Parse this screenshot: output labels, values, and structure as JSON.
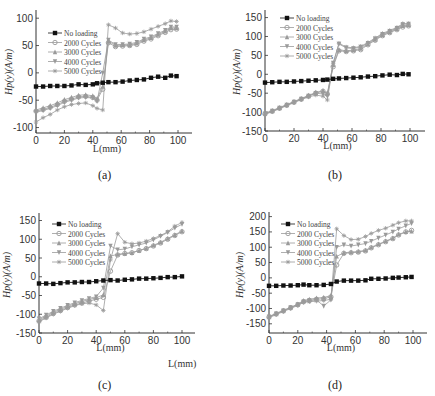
{
  "figure": {
    "captions": [
      "(a)",
      "(b)",
      "(c)",
      "(d)"
    ],
    "stray_xlabel": "L(mm)"
  },
  "colors": {
    "no_loading": "#111111",
    "cycles": "#9a9a9a",
    "axis": "#333333"
  },
  "chart_data": [
    {
      "type": "line",
      "panel": "(a)",
      "xlabel": "L(mm)",
      "ylabel": "Hp(y)(A/m)",
      "xlim": [
        0,
        110
      ],
      "ylim": [
        -110,
        115
      ],
      "xticks": [
        0,
        20,
        40,
        60,
        80,
        100
      ],
      "yticks": [
        -100,
        -50,
        0,
        50,
        100
      ],
      "x": [
        0,
        5,
        10,
        15,
        20,
        25,
        30,
        35,
        40,
        43,
        47,
        51,
        56,
        61,
        66,
        71,
        76,
        81,
        86,
        91,
        95,
        99
      ],
      "legend_position": "upper left",
      "series": [
        {
          "name": "No loading",
          "marker": "square",
          "values": [
            -25,
            -25,
            -24,
            -24,
            -24,
            -23,
            -21,
            -22,
            -21,
            -19,
            -18,
            -17,
            -17,
            -16,
            -14,
            -13,
            -12,
            -9,
            -7,
            -9,
            -5,
            -6
          ]
        },
        {
          "name": "2000 Cycles",
          "marker": "circle",
          "values": [
            -70,
            -67,
            -63,
            -58,
            -52,
            -48,
            -44,
            -43,
            -45,
            -50,
            -30,
            55,
            48,
            49,
            50,
            52,
            58,
            62,
            68,
            74,
            79,
            80
          ]
        },
        {
          "name": "3000 Cycles",
          "marker": "triangle-up",
          "values": [
            -68,
            -64,
            -60,
            -55,
            -49,
            -45,
            -41,
            -40,
            -42,
            -47,
            -25,
            58,
            50,
            51,
            51,
            54,
            60,
            64,
            70,
            76,
            82,
            82
          ]
        },
        {
          "name": "4000 Cycles",
          "marker": "triangle-down",
          "values": [
            -72,
            -69,
            -65,
            -60,
            -54,
            -50,
            -46,
            -45,
            -46,
            -52,
            0,
            60,
            52,
            52,
            53,
            56,
            62,
            66,
            72,
            78,
            84,
            84
          ]
        },
        {
          "name": "5000 Cycles",
          "marker": "star",
          "values": [
            -90,
            -82,
            -76,
            -68,
            -62,
            -58,
            -56,
            -55,
            -60,
            -65,
            -68,
            88,
            82,
            73,
            71,
            72,
            75,
            80,
            85,
            90,
            95,
            94
          ]
        }
      ]
    },
    {
      "type": "line",
      "panel": "(b)",
      "xlabel": "L(mm)",
      "ylabel": "Hp(y)(A/m)",
      "xlim": [
        0,
        110
      ],
      "ylim": [
        -150,
        170
      ],
      "xticks": [
        0,
        20,
        40,
        60,
        80,
        100
      ],
      "yticks": [
        -150,
        -100,
        -50,
        0,
        50,
        100,
        150
      ],
      "x": [
        0,
        5,
        10,
        15,
        20,
        25,
        30,
        35,
        40,
        43,
        47,
        51,
        56,
        61,
        66,
        71,
        76,
        81,
        86,
        91,
        95,
        99
      ],
      "legend_position": "upper left",
      "series": [
        {
          "name": "No loading",
          "marker": "square",
          "values": [
            -22,
            -21,
            -20,
            -20,
            -19,
            -18,
            -17,
            -16,
            -15,
            -14,
            -12,
            -11,
            -10,
            -9,
            -8,
            -6,
            -5,
            -3,
            -1,
            -2,
            1,
            0
          ]
        },
        {
          "name": "2000 Cycles",
          "marker": "circle",
          "values": [
            -105,
            -98,
            -90,
            -82,
            -74,
            -66,
            -58,
            -50,
            -45,
            -52,
            20,
            62,
            60,
            62,
            65,
            78,
            90,
            102,
            110,
            118,
            125,
            128
          ]
        },
        {
          "name": "3000 Cycles",
          "marker": "triangle-up",
          "values": [
            -103,
            -96,
            -88,
            -80,
            -72,
            -64,
            -56,
            -48,
            -43,
            -50,
            25,
            65,
            62,
            64,
            68,
            80,
            92,
            104,
            112,
            120,
            128,
            130
          ]
        },
        {
          "name": "4000 Cycles",
          "marker": "triangle-down",
          "values": [
            -104,
            -97,
            -89,
            -81,
            -73,
            -65,
            -57,
            -50,
            -52,
            -58,
            30,
            80,
            70,
            68,
            72,
            82,
            94,
            106,
            114,
            122,
            132,
            133
          ]
        },
        {
          "name": "5000 Cycles",
          "marker": "star",
          "values": [
            -106,
            -99,
            -91,
            -83,
            -75,
            -67,
            -60,
            -55,
            -58,
            -68,
            28,
            82,
            72,
            70,
            74,
            84,
            96,
            108,
            116,
            124,
            134,
            134
          ]
        }
      ]
    },
    {
      "type": "line",
      "panel": "(c)",
      "xlabel": "L(mm)",
      "ylabel": "Hp(y)(A/m)",
      "xlim": [
        0,
        110
      ],
      "ylim": [
        -150,
        170
      ],
      "xticks": [
        0,
        20,
        40,
        60,
        80,
        100
      ],
      "yticks": [
        -150,
        -100,
        -50,
        0,
        50,
        100,
        150
      ],
      "x": [
        0,
        5,
        10,
        15,
        20,
        25,
        30,
        35,
        40,
        45,
        50,
        55,
        60,
        65,
        70,
        75,
        80,
        85,
        90,
        95,
        100
      ],
      "legend_position": "upper left",
      "series": [
        {
          "name": "No loading",
          "marker": "square",
          "values": [
            -18,
            -18,
            -19,
            -17,
            -15,
            -15,
            -14,
            -14,
            -12,
            -10,
            -9,
            -10,
            -8,
            -7,
            -5,
            -5,
            -4,
            -3,
            -1,
            -1,
            1
          ]
        },
        {
          "name": "2000 Cycles",
          "marker": "circle",
          "values": [
            -118,
            -108,
            -98,
            -90,
            -82,
            -75,
            -70,
            -65,
            -60,
            -55,
            15,
            58,
            62,
            64,
            70,
            75,
            82,
            90,
            100,
            110,
            120
          ]
        },
        {
          "name": "3000 Cycles",
          "marker": "triangle-up",
          "values": [
            -115,
            -105,
            -95,
            -87,
            -79,
            -72,
            -66,
            -61,
            -56,
            -48,
            55,
            60,
            62,
            64,
            70,
            76,
            84,
            92,
            102,
            112,
            122
          ]
        },
        {
          "name": "4000 Cycles",
          "marker": "triangle-down",
          "values": [
            -112,
            -102,
            -92,
            -84,
            -76,
            -69,
            -63,
            -58,
            -53,
            -30,
            82,
            72,
            74,
            80,
            85,
            90,
            98,
            108,
            118,
            130,
            140
          ]
        },
        {
          "name": "5000 Cycles",
          "marker": "star",
          "values": [
            -120,
            -110,
            -100,
            -92,
            -84,
            -77,
            -72,
            -70,
            -75,
            -90,
            45,
            115,
            92,
            88,
            90,
            95,
            102,
            110,
            120,
            135,
            145
          ]
        }
      ]
    },
    {
      "type": "line",
      "panel": "(d)",
      "xlabel": "L(mm)",
      "ylabel": "Hp(y)(A/m)",
      "xlim": [
        0,
        110
      ],
      "ylim": [
        -180,
        215
      ],
      "xticks": [
        0,
        20,
        40,
        60,
        80,
        100
      ],
      "yticks": [
        -150,
        -100,
        -50,
        0,
        50,
        100,
        150,
        200
      ],
      "x": [
        0,
        5,
        10,
        15,
        20,
        24,
        28,
        33,
        38,
        43,
        47,
        52,
        57,
        62,
        67,
        71,
        76,
        81,
        86,
        90,
        95,
        99
      ],
      "legend_position": "upper left",
      "series": [
        {
          "name": "No loading",
          "marker": "square",
          "values": [
            -26,
            -26,
            -25,
            -25,
            -24,
            -22,
            -24,
            -24,
            -23,
            -20,
            -12,
            -9,
            -9,
            -9,
            -8,
            -3,
            -3,
            -2,
            0,
            1,
            2,
            3
          ]
        },
        {
          "name": "2000 Cycles",
          "marker": "circle",
          "values": [
            -128,
            -118,
            -108,
            -98,
            -88,
            -78,
            -74,
            -70,
            -68,
            -62,
            42,
            80,
            82,
            84,
            88,
            98,
            108,
            118,
            128,
            140,
            150,
            155
          ]
        },
        {
          "name": "3000 Cycles",
          "marker": "triangle-up",
          "values": [
            -126,
            -116,
            -106,
            -96,
            -86,
            -74,
            -70,
            -66,
            -64,
            -58,
            70,
            82,
            84,
            86,
            90,
            100,
            110,
            120,
            130,
            142,
            150,
            152
          ]
        },
        {
          "name": "4000 Cycles",
          "marker": "triangle-down",
          "values": [
            -127,
            -117,
            -107,
            -97,
            -87,
            -78,
            -74,
            -72,
            -92,
            -72,
            100,
            108,
            104,
            108,
            112,
            120,
            130,
            140,
            150,
            160,
            170,
            178
          ]
        },
        {
          "name": "5000 Cycles",
          "marker": "star",
          "values": [
            -130,
            -120,
            -110,
            -100,
            -90,
            -80,
            -78,
            -76,
            -74,
            -70,
            160,
            138,
            125,
            126,
            135,
            145,
            155,
            162,
            172,
            180,
            186,
            186
          ]
        }
      ]
    }
  ],
  "layout": {
    "panels": [
      {
        "x0": 36,
        "x100": 178,
        "xEnd": 192,
        "yTop": 10,
        "yBottom": 133,
        "yMin": -110,
        "yMax": 115,
        "ylabelX": 12,
        "ylabelY": 72,
        "xlabelY": 152,
        "legendX": 48,
        "legendY": 33,
        "captionX": 103,
        "captionY": 176
      },
      {
        "x0": 265,
        "x100": 410,
        "xEnd": 425,
        "yTop": 10,
        "yBottom": 131,
        "yMin": -150,
        "yMax": 170,
        "ylabelX": 240,
        "ylabelY": 72,
        "xlabelY": 149,
        "legendX": 280,
        "legendY": 18,
        "captionX": 333,
        "captionY": 176
      },
      {
        "x0": 39,
        "x100": 182,
        "xEnd": 195,
        "yTop": 213,
        "yBottom": 333,
        "yMin": -150,
        "yMax": 170,
        "ylabelX": 10,
        "ylabelY": 275,
        "xlabelY": 351,
        "legendX": 52,
        "legendY": 224,
        "captionX": 103,
        "captionY": 386
      },
      {
        "x0": 269,
        "x100": 413,
        "xEnd": 427,
        "yTop": 212,
        "yBottom": 333,
        "yMin": -180,
        "yMax": 215,
        "ylabelX": 243,
        "ylabelY": 275,
        "xlabelY": 351,
        "legendX": 281,
        "legendY": 224,
        "captionX": 333,
        "captionY": 386
      }
    ]
  }
}
